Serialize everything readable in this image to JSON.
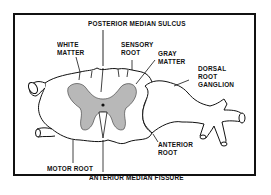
{
  "figure": {
    "labels": {
      "posterior_median_sulcus": "POSTERIOR MEDIAN SULCUS",
      "white_matter": "WHITE\nMATTER",
      "sensory_root": "SENSORY\nROOT",
      "gray_matter": "GRAY\nMATTER",
      "dorsal_root_ganglion": "DORSAL\nROOT\nGANGLION",
      "anterior_root": "ANTERIOR\nROOT",
      "motor_root": "MOTOR ROOT",
      "anterior_median_fissure": "ANTERIOR MEDIAN FISSURE"
    },
    "colors": {
      "line": "#111111",
      "gray_matter": "#b8b8b8",
      "background": "#ffffff"
    }
  }
}
